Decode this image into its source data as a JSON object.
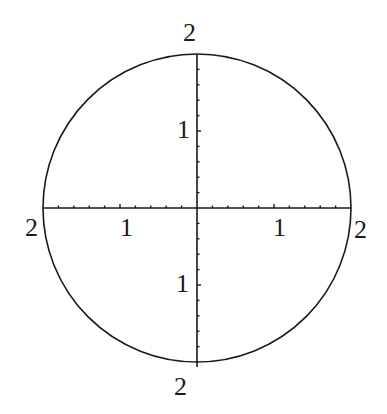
{
  "diagram": {
    "type": "circle-with-axes",
    "center": {
      "x": 197,
      "y": 208
    },
    "radius": 154,
    "stroke_color": "#1a1a1a",
    "labels": {
      "top": "2",
      "bottom": "2",
      "left": "2",
      "right": "2",
      "x_left_mid": "1",
      "x_right_mid": "1",
      "y_top_mid": "1",
      "y_bottom_mid": "1"
    },
    "ticks_per_half_axis": 10
  }
}
